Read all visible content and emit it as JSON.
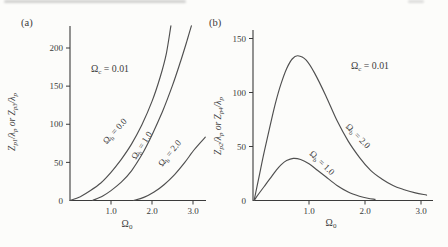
{
  "style": {
    "background": "#fcfcfa",
    "ink": "#3b3b3b",
    "curve_color": "#4f4f4f"
  },
  "chart_data": [
    {
      "type": "line",
      "panel_label": "(a)",
      "xlabel": "Ω_{0}",
      "ylabel": "Z_{p1}/λ_{p} or Z_{p3}/λ_{p}",
      "annotation": {
        "text": "Ω_{c} = 0.01",
        "px": [
          110,
          72
        ]
      },
      "xlim": [
        0,
        3.35
      ],
      "ylim": [
        0,
        232
      ],
      "grid": false,
      "xticks": [
        {
          "v": 1.0,
          "label": "1.0"
        },
        {
          "v": 2.0,
          "label": "2.0"
        },
        {
          "v": 3.0,
          "label": "3.0"
        }
      ],
      "yticks": [
        {
          "v": 0,
          "label": "0"
        },
        {
          "v": 50,
          "label": "50"
        },
        {
          "v": 100,
          "label": "100"
        },
        {
          "v": 150,
          "label": "150"
        },
        {
          "v": 200,
          "label": "200"
        }
      ],
      "xlabel_px": [
        127,
        227
      ],
      "ylabel_px": [
        15,
        122
      ],
      "series": [
        {
          "name": "Ω_{b} = 0.0",
          "label_px": [
            117,
            133
          ],
          "label_angle": -48,
          "points": [
            [
              0,
              0
            ],
            [
              0.25,
              5
            ],
            [
              0.5,
              13
            ],
            [
              0.75,
              23
            ],
            [
              1.0,
              37
            ],
            [
              1.25,
              54
            ],
            [
              1.5,
              74
            ],
            [
              1.75,
              99
            ],
            [
              2.0,
              130
            ],
            [
              2.2,
              162
            ],
            [
              2.35,
              193
            ],
            [
              2.46,
              229
            ]
          ]
        },
        {
          "name": "Ω_{b} = 1.0",
          "label_px": [
            144,
            147
          ],
          "label_angle": -57,
          "points": [
            [
              0.55,
              0
            ],
            [
              0.8,
              6
            ],
            [
              1.0,
              13
            ],
            [
              1.25,
              24
            ],
            [
              1.5,
              39
            ],
            [
              1.75,
              60
            ],
            [
              2.0,
              86
            ],
            [
              2.25,
              116
            ],
            [
              2.5,
              151
            ],
            [
              2.7,
              183
            ],
            [
              2.85,
              209
            ],
            [
              2.96,
              229
            ]
          ]
        },
        {
          "name": "Ω_{b} = 2.0",
          "label_px": [
            172,
            155
          ],
          "label_angle": -51,
          "points": [
            [
              1.55,
              0
            ],
            [
              1.8,
              4
            ],
            [
              2.05,
              11
            ],
            [
              2.3,
              21
            ],
            [
              2.55,
              34
            ],
            [
              2.8,
              50
            ],
            [
              3.05,
              68
            ],
            [
              3.3,
              83
            ]
          ]
        }
      ]
    },
    {
      "type": "line",
      "panel_label": "(b)",
      "xlabel": "Ω_{0}",
      "ylabel": "Z_{p2}/λ_{p} or Z_{p4}/λ_{p}",
      "annotation": {
        "text": "Ω_{c} = 0.01",
        "px": [
          370,
          69
        ]
      },
      "xlim": [
        0,
        3.2
      ],
      "ylim": [
        0,
        158
      ],
      "grid": false,
      "xticks": [
        {
          "v": 1.0,
          "label": "1.0"
        },
        {
          "v": 2.0,
          "label": "2.0"
        },
        {
          "v": 3.0,
          "label": "3.0"
        }
      ],
      "yticks": [
        {
          "v": 0,
          "label": "0"
        },
        {
          "v": 50,
          "label": "50"
        },
        {
          "v": 100,
          "label": "100"
        },
        {
          "v": 150,
          "label": "150"
        }
      ],
      "xlabel_px": [
        331,
        226
      ],
      "ylabel_px": [
        221,
        126
      ],
      "series": [
        {
          "name": "Ω_{b} = 2.0",
          "label_px": [
            356,
            138
          ],
          "label_angle": 46,
          "points": [
            [
              0.02,
              0
            ],
            [
              0.1,
              20
            ],
            [
              0.2,
              45
            ],
            [
              0.3,
              68
            ],
            [
              0.4,
              90
            ],
            [
              0.5,
              108
            ],
            [
              0.6,
              122
            ],
            [
              0.7,
              131
            ],
            [
              0.8,
              134
            ],
            [
              0.95,
              130
            ],
            [
              1.1,
              118
            ],
            [
              1.3,
              97
            ],
            [
              1.5,
              74
            ],
            [
              1.7,
              55
            ],
            [
              1.9,
              40
            ],
            [
              2.1,
              28
            ],
            [
              2.3,
              20
            ],
            [
              2.5,
              14
            ],
            [
              2.7,
              10
            ],
            [
              2.9,
              7
            ],
            [
              3.1,
              5
            ]
          ]
        },
        {
          "name": "Ω_{b} = 1.0",
          "label_px": [
            320,
            165
          ],
          "label_angle": 44,
          "points": [
            [
              0.02,
              0
            ],
            [
              0.1,
              6
            ],
            [
              0.2,
              13
            ],
            [
              0.3,
              20
            ],
            [
              0.4,
              27
            ],
            [
              0.5,
              33
            ],
            [
              0.6,
              37
            ],
            [
              0.72,
              39
            ],
            [
              0.85,
              38
            ],
            [
              1.0,
              34
            ],
            [
              1.15,
              28
            ],
            [
              1.3,
              22
            ],
            [
              1.5,
              14
            ],
            [
              1.7,
              8
            ],
            [
              1.9,
              4
            ],
            [
              2.05,
              2
            ],
            [
              2.18,
              1
            ]
          ]
        }
      ]
    }
  ]
}
